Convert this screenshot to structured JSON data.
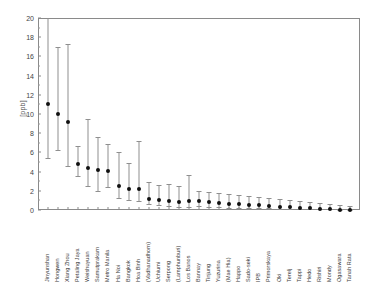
{
  "chart_data": {
    "type": "scatter",
    "title": "",
    "xlabel": "",
    "ylabel": "[ppb]",
    "ylim": [
      0,
      20
    ],
    "yticks": [
      0,
      2,
      4,
      6,
      8,
      10,
      12,
      14,
      16,
      18,
      20
    ],
    "grid": false,
    "legend": null,
    "error_bars": "asymmetric",
    "categories": [
      "Jinyunshan",
      "Hongwen",
      "Xiang Zhou",
      "Petaling Jaya",
      "Weishuyuan",
      "Samutprakarn",
      "Metro Manila",
      "Ha Noi",
      "Bangkok",
      "Hoa Binh",
      "(Vadhanadhorn)",
      "Uchiumi",
      "Serpong",
      "(Lamphunburi)",
      "Los Banos",
      "Bannay",
      "Tinjung",
      "Yuzurina",
      "(Mae Hia)",
      "Happo",
      "Sado-seki",
      "IPB",
      "Primorskaya",
      "Oki",
      "Terelj",
      "Tappi",
      "Hedo",
      "Rishiri",
      "Mondy",
      "Ogasawara",
      "Tanah Rata"
    ],
    "values": [
      11.2,
      10.2,
      9.4,
      5.0,
      4.6,
      4.4,
      4.3,
      2.7,
      2.4,
      2.4,
      1.4,
      1.2,
      1.1,
      1.0,
      1.1,
      1.1,
      1.0,
      0.9,
      0.8,
      0.8,
      0.7,
      0.7,
      0.6,
      0.5,
      0.5,
      0.4,
      0.4,
      0.3,
      0.3,
      0.2,
      0.2
    ],
    "upper": [
      20.0,
      17.0,
      17.3,
      6.7,
      9.5,
      7.6,
      6.9,
      6.0,
      4.9,
      7.2,
      2.9,
      2.6,
      2.7,
      2.5,
      3.6,
      2.0,
      1.9,
      1.8,
      1.7,
      1.6,
      1.5,
      1.4,
      1.3,
      1.1,
      1.0,
      0.9,
      0.8,
      0.7,
      0.6,
      0.5,
      0.4
    ],
    "lower": [
      5.4,
      6.2,
      4.6,
      3.5,
      2.5,
      2.0,
      2.4,
      1.2,
      1.0,
      0.9,
      0.6,
      0.5,
      0.4,
      0.3,
      0.3,
      0.4,
      0.3,
      0.3,
      0.2,
      0.2,
      0.2,
      0.2,
      0.2,
      0.1,
      0.1,
      0.1,
      0.1,
      0.1,
      0.1,
      0.05,
      0.05
    ]
  }
}
